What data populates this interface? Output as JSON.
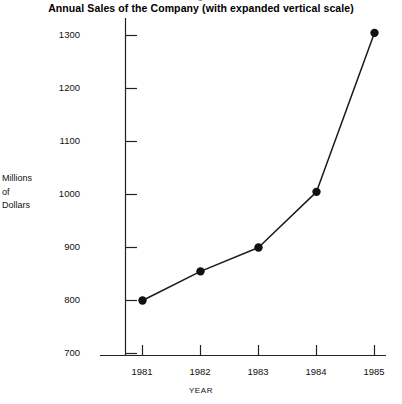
{
  "chart_data": {
    "type": "line",
    "title": "Annual Sales of the Company (with expanded vertical scale)",
    "xlabel": "YEAR",
    "ylabel": "Millions of Dollars",
    "ylabel_lines": [
      "Millions",
      "of",
      "Dollars"
    ],
    "categories": [
      "1981",
      "1982",
      "1983",
      "1984",
      "1985"
    ],
    "values": [
      800,
      855,
      900,
      1005,
      1305
    ],
    "series": [
      {
        "name": "Annual Sales",
        "values": [
          800,
          855,
          900,
          1005,
          1305
        ]
      }
    ],
    "ylim": [
      650,
      1340
    ],
    "yticks": [
      700,
      800,
      900,
      1000,
      1100,
      1200,
      1300
    ],
    "ytick_labels": [
      "700",
      "800",
      "900",
      "1000",
      "1100",
      "1200",
      "1300"
    ],
    "xtick_labels": [
      "1981",
      "1982",
      "1983",
      "1984",
      "1985"
    ],
    "grid": false,
    "legend": false,
    "marker": "filled-circle",
    "line_color": "#1a1a1a",
    "marker_color": "#111111",
    "axis_color": "#222222",
    "background_color": "#ffffff"
  }
}
